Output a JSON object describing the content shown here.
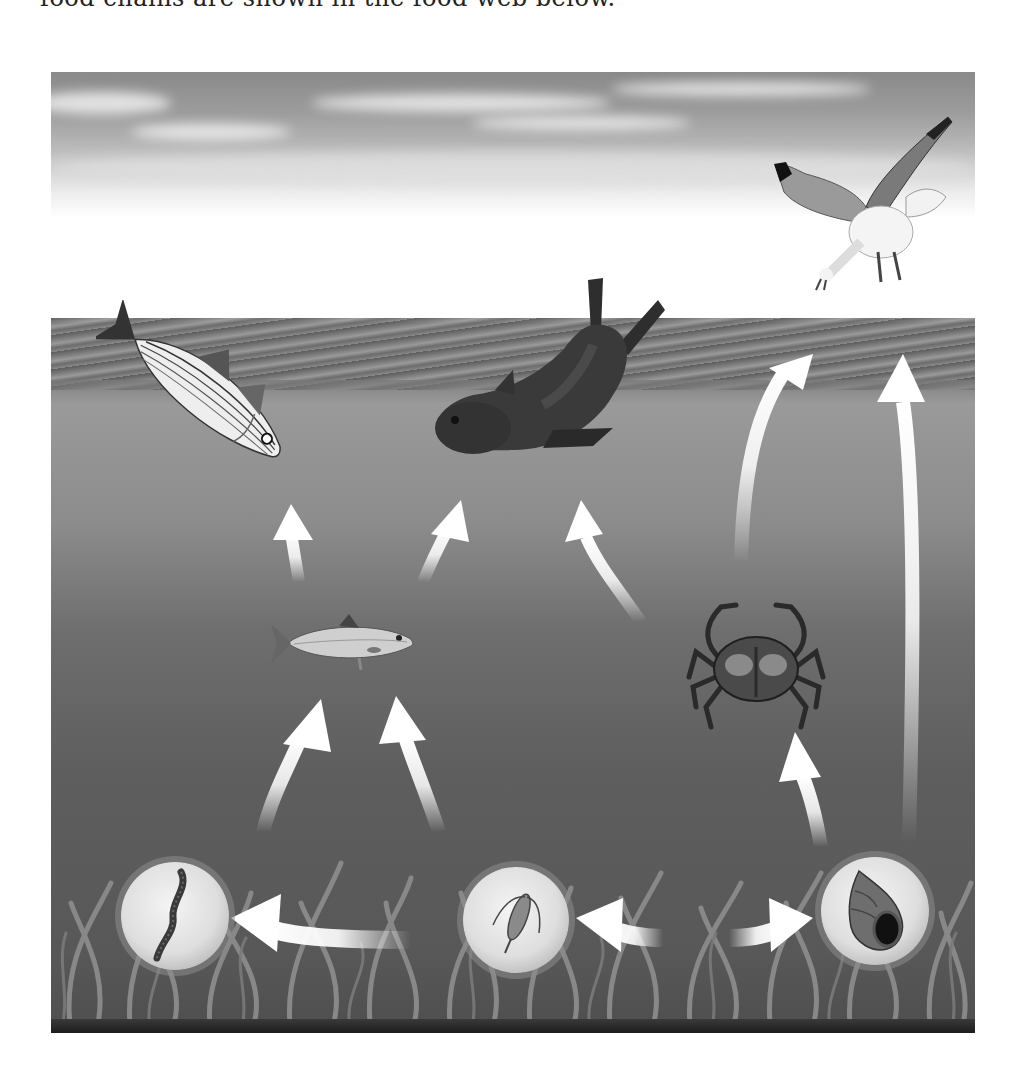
{
  "header": {
    "cut_off_text": "food chains are shown in the food web below."
  },
  "diagram": {
    "title": "Marine food web",
    "zones": [
      "sky",
      "sea surface",
      "open water",
      "seabed with seagrass"
    ],
    "organisms": [
      {
        "id": "gull",
        "name": "Seagull",
        "zone": "sky"
      },
      {
        "id": "striped_bass",
        "name": "Striped bass",
        "zone": "surface"
      },
      {
        "id": "seal",
        "name": "Seal",
        "zone": "surface"
      },
      {
        "id": "herring",
        "name": "Herring",
        "zone": "open water"
      },
      {
        "id": "crab",
        "name": "Crab",
        "zone": "open water"
      },
      {
        "id": "worm",
        "name": "Worm",
        "zone": "seabed"
      },
      {
        "id": "copepod",
        "name": "Copepod (zooplankton)",
        "zone": "seabed"
      },
      {
        "id": "snail",
        "name": "Snail",
        "zone": "seabed"
      },
      {
        "id": "seagrass",
        "name": "Seagrass",
        "zone": "seabed"
      }
    ],
    "arrows": [
      {
        "from": "herring",
        "to": "striped_bass"
      },
      {
        "from": "herring",
        "to": "seal"
      },
      {
        "from": "crab",
        "to": "seal"
      },
      {
        "from": "crab",
        "to": "gull"
      },
      {
        "from": "snail",
        "to": "gull"
      },
      {
        "from": "snail",
        "to": "crab"
      },
      {
        "from": "worm",
        "to": "herring"
      },
      {
        "from": "copepod",
        "to": "herring"
      },
      {
        "from": "copepod",
        "to": "worm"
      },
      {
        "from": "seagrass",
        "to": "copepod"
      },
      {
        "from": "seagrass",
        "to": "snail"
      }
    ]
  },
  "colors": {
    "arrow": "#ffffff",
    "water_top": "#9a9a9a",
    "water_bottom": "#4e4e4e",
    "seagrass": "#8c8c8c"
  }
}
